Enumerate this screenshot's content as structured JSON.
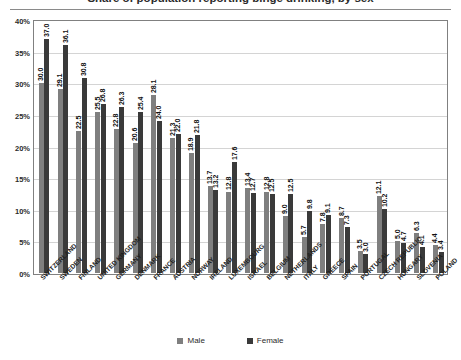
{
  "chart_data": {
    "type": "bar",
    "title": "Share of population reporting binge drinking, by sex",
    "xlabel": "",
    "ylabel": "",
    "ylim": [
      0,
      40
    ],
    "ytick_labels": [
      "0%",
      "5%",
      "10%",
      "15%",
      "20%",
      "25%",
      "30%",
      "35%",
      "40%"
    ],
    "ytick_values": [
      0,
      5,
      10,
      15,
      20,
      25,
      30,
      35,
      40
    ],
    "grid": true,
    "legend_position": "bottom",
    "categories": [
      "SWITZERLAND",
      "SWEDEN",
      "FINLAND",
      "UNITED KINGDOM",
      "GERMANY",
      "DENMARK",
      "FRANCE",
      "AUSTRIA",
      "NORWAY",
      "IRELAND",
      "LUXEMBOURG",
      "ISRAEL",
      "BELGIUM",
      "NETHERLANDS",
      "ITALY",
      "GREECE",
      "SPAIN",
      "PORTUGAL",
      "CZECH REPUBLIC",
      "HUNGARY",
      "SLOVENIA",
      "POLAND"
    ],
    "series": [
      {
        "name": "Male",
        "color": "#7f7f7f",
        "values": [
          30.0,
          29.1,
          22.5,
          25.5,
          22.8,
          20.6,
          28.1,
          21.3,
          18.9,
          13.7,
          12.8,
          13.4,
          12.8,
          9.0,
          5.7,
          7.8,
          8.7,
          3.5,
          12.1,
          5.0,
          6.3,
          4.4
        ]
      },
      {
        "name": "Female",
        "color": "#3a3a3a",
        "values": [
          37.0,
          36.1,
          30.8,
          26.8,
          26.3,
          25.4,
          24.0,
          22.0,
          21.8,
          13.2,
          17.6,
          12.7,
          12.5,
          12.5,
          9.8,
          9.1,
          7.3,
          3.0,
          10.2,
          4.7,
          4.1,
          3.4
        ]
      }
    ],
    "legend": [
      {
        "label": "Male",
        "color": "#7f7f7f"
      },
      {
        "label": "Female",
        "color": "#3a3a3a"
      }
    ]
  }
}
